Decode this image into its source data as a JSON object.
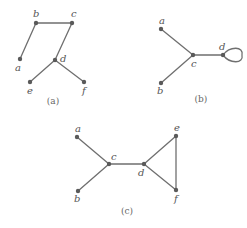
{
  "figure": {
    "graphs": [
      {
        "id": "a",
        "caption": "(a)",
        "nodes": [
          {
            "id": "a",
            "label": "a",
            "x": 20,
            "y": 59,
            "lx": 15,
            "ly": 71
          },
          {
            "id": "b",
            "label": "b",
            "x": 36,
            "y": 23,
            "lx": 33,
            "ly": 17
          },
          {
            "id": "c",
            "label": "c",
            "x": 72,
            "y": 23,
            "lx": 71,
            "ly": 17
          },
          {
            "id": "d",
            "label": "d",
            "x": 55,
            "y": 60,
            "lx": 60,
            "ly": 62
          },
          {
            "id": "e",
            "label": "e",
            "x": 30,
            "y": 82,
            "lx": 27,
            "ly": 94
          },
          {
            "id": "f",
            "label": "f",
            "x": 84,
            "y": 82,
            "lx": 82,
            "ly": 94
          }
        ],
        "edges": [
          [
            "a",
            "b"
          ],
          [
            "b",
            "c"
          ],
          [
            "c",
            "d"
          ],
          [
            "d",
            "e"
          ],
          [
            "d",
            "f"
          ]
        ],
        "caption_pos": {
          "x": 53,
          "y": 104
        }
      },
      {
        "id": "b",
        "caption": "(b)",
        "nodes": [
          {
            "id": "a",
            "label": "a",
            "x": 161,
            "y": 29,
            "lx": 159,
            "ly": 24
          },
          {
            "id": "b",
            "label": "b",
            "x": 161,
            "y": 83,
            "lx": 157,
            "ly": 94
          },
          {
            "id": "c",
            "label": "c",
            "x": 193,
            "y": 55,
            "lx": 191,
            "ly": 67
          },
          {
            "id": "d",
            "label": "d",
            "x": 223,
            "y": 55,
            "lx": 219,
            "ly": 50
          }
        ],
        "edges": [
          [
            "a",
            "c"
          ],
          [
            "b",
            "c"
          ],
          [
            "c",
            "d"
          ]
        ],
        "loops": [
          {
            "node": "d",
            "to_x": 242
          }
        ],
        "caption_pos": {
          "x": 201,
          "y": 102
        }
      },
      {
        "id": "c",
        "caption": "(c)",
        "nodes": [
          {
            "id": "a",
            "label": "a",
            "x": 77,
            "y": 137,
            "lx": 75,
            "ly": 132
          },
          {
            "id": "b",
            "label": "b",
            "x": 78,
            "y": 191,
            "lx": 74,
            "ly": 202
          },
          {
            "id": "c",
            "label": "c",
            "x": 109,
            "y": 164,
            "lx": 111,
            "ly": 160
          },
          {
            "id": "d",
            "label": "d",
            "x": 144,
            "y": 164,
            "lx": 138,
            "ly": 176
          },
          {
            "id": "e",
            "label": "e",
            "x": 176,
            "y": 136,
            "lx": 174,
            "ly": 131
          },
          {
            "id": "f",
            "label": "f",
            "x": 176,
            "y": 190,
            "lx": 174,
            "ly": 202
          }
        ],
        "edges": [
          [
            "a",
            "c"
          ],
          [
            "b",
            "c"
          ],
          [
            "c",
            "d"
          ],
          [
            "d",
            "e"
          ],
          [
            "d",
            "f"
          ],
          [
            "e",
            "f"
          ]
        ],
        "caption_pos": {
          "x": 127,
          "y": 214
        }
      }
    ]
  }
}
